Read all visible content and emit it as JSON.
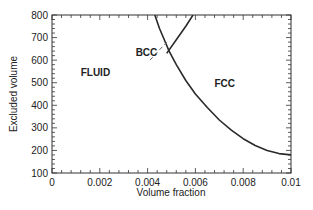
{
  "chart_data": {
    "type": "line",
    "title": "",
    "xlabel": "Volume fraction",
    "ylabel": "Excluded volume",
    "xlim": [
      0,
      0.01
    ],
    "ylim": [
      100,
      800
    ],
    "x_ticks": [
      "0",
      "0.002",
      "0.004",
      "0.006",
      "0.008",
      "0.01"
    ],
    "y_ticks": [
      "100",
      "200",
      "300",
      "400",
      "500",
      "600",
      "700",
      "800"
    ],
    "grid": false,
    "legend": null,
    "regions": [
      {
        "label": "FLUID",
        "x": 0.0012,
        "y": 530
      },
      {
        "label": "BCC",
        "x": 0.0035,
        "y": 620
      },
      {
        "label": "FCC",
        "x": 0.0068,
        "y": 480
      }
    ],
    "series": [
      {
        "name": "fluid-solid boundary",
        "style": "solid",
        "x": [
          0.0043,
          0.0045,
          0.0047,
          0.0049,
          0.0052,
          0.0056,
          0.006,
          0.0065,
          0.007,
          0.0075,
          0.008,
          0.0085,
          0.009,
          0.0095,
          0.01
        ],
        "y": [
          800,
          740,
          690,
          640,
          580,
          510,
          450,
          390,
          335,
          290,
          252,
          222,
          200,
          186,
          180
        ]
      },
      {
        "name": "bcc-fcc boundary",
        "style": "solid",
        "x": [
          0.0048,
          0.0052,
          0.0056,
          0.0059
        ],
        "y": [
          630,
          690,
          750,
          800
        ]
      },
      {
        "name": "metastable bcc extension",
        "style": "dashed",
        "x": [
          0.0041,
          0.0048
        ],
        "y": [
          600,
          680
        ]
      }
    ]
  }
}
